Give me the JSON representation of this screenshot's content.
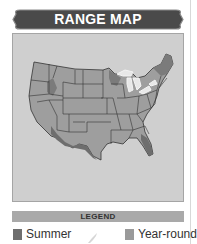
{
  "header": {
    "title": "RANGE MAP"
  },
  "map": {
    "region": "United States (contiguous)",
    "colors": {
      "panel_bg": "#cfcfcf",
      "land_default": "#9e9e9e",
      "summer_range": "#7b7b7b",
      "year_round_range": "#9e9e9e",
      "great_lakes": "#e8e8e8",
      "state_lines": "#333333"
    }
  },
  "legend": {
    "title": "LEGEND",
    "items": [
      {
        "label": "Summer",
        "color": "#6e6e6e",
        "icon": "summer-swatch"
      },
      {
        "label": "Year-round",
        "color": "#9a9a9a",
        "icon": "year-round-swatch"
      }
    ],
    "center_icon": "bird-silhouette-icon"
  },
  "colors": {
    "banner": "#4a4a4a",
    "banner_border": "#8a8a8a",
    "legend_bar": "#a9a9a9"
  }
}
